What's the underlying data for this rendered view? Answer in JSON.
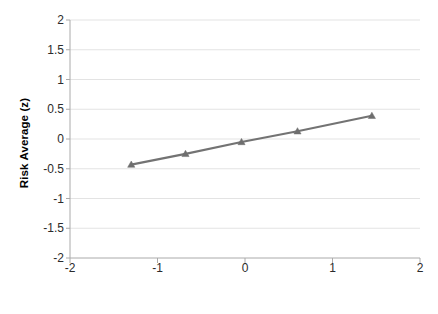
{
  "chart_data": {
    "type": "line",
    "title": "",
    "subtitle": "",
    "xlabel": "Traumatic Experience Score (10,25,50,75,90 Pctl)",
    "ylabel": "Risk Average (z)",
    "xlim": [
      -2,
      2
    ],
    "ylim": [
      -2,
      2
    ],
    "xticks": [
      -2,
      -1,
      0,
      1,
      2
    ],
    "xtick_labels": [
      "-2",
      "-1",
      "0",
      "1",
      "2"
    ],
    "yticks": [
      -2,
      -1.5,
      -1,
      -0.5,
      0,
      0.5,
      1,
      1.5,
      2
    ],
    "ytick_labels": [
      "-2",
      "-1.5",
      "-1",
      "-0.5",
      "0",
      "0.5",
      "1",
      "1.5",
      "2"
    ],
    "grid": "horizontal",
    "legend": "none",
    "marker": "triangle",
    "series": [
      {
        "name": "Risk Average (z)",
        "color": "#737373",
        "marker_color": "#6e6e6e",
        "x": [
          -1.3,
          -0.68,
          -0.04,
          0.6,
          1.45
        ],
        "y": [
          -0.43,
          -0.25,
          -0.05,
          0.13,
          0.39
        ],
        "percentiles": [
          "10",
          "25",
          "50",
          "75",
          "90"
        ]
      }
    ],
    "colors": {
      "line": "#737373",
      "marker": "#6e6e6e",
      "grid": "#e3e3e3",
      "axis": "#aaaaaa",
      "text": "#2b2b2b",
      "title_text": "#000000",
      "background": "#ffffff"
    }
  },
  "axes": {
    "y_title": "Risk Average (z)",
    "x_title": "Traumatic Experience Score (10,25,50,75,90 Pctl)"
  }
}
